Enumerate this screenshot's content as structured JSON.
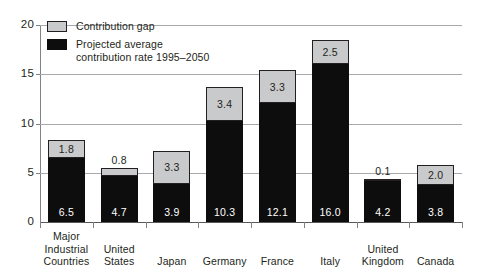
{
  "chart_data": {
    "type": "bar",
    "title": "",
    "subtitle": "",
    "xlabel": "",
    "ylabel": "",
    "ylim": [
      0,
      20
    ],
    "yticks": [
      "0",
      "5",
      "10",
      "15",
      "20"
    ],
    "ytick_values": [
      0,
      5,
      10,
      15,
      20
    ],
    "grid": true,
    "stacked": true,
    "legend_position": "top-left",
    "categories": [
      "Major\nIndustrial\nCountries",
      "United\nStates",
      "Japan",
      "Germany",
      "France",
      "Italy",
      "United\nKingdom",
      "Canada"
    ],
    "series": [
      {
        "name": "Projected average contribution rate 1995–2050",
        "color": "#0d0d0d",
        "values": [
          6.5,
          4.7,
          3.9,
          10.3,
          12.1,
          16.0,
          4.2,
          3.8
        ],
        "labels": [
          "6.5",
          "4.7",
          "3.9",
          "10.3",
          "12.1",
          "16.0",
          "4.2",
          "3.8"
        ]
      },
      {
        "name": "Contribution gap",
        "color": "#c9cacb",
        "values": [
          1.8,
          0.8,
          3.3,
          3.4,
          3.3,
          2.5,
          0.1,
          2.0
        ],
        "labels": [
          "1.8",
          "0.8",
          "3.3",
          "3.4",
          "3.3",
          "2.5",
          "0.1",
          "2.0"
        ]
      }
    ],
    "totals": [
      8.3,
      5.5,
      7.2,
      13.7,
      15.4,
      18.5,
      4.3,
      5.8
    ]
  },
  "legend": {
    "items": [
      {
        "label": "Contribution gap",
        "swatch": "gap"
      },
      {
        "label": "Projected average\ncontribution rate 1995–2050",
        "swatch": "dark"
      }
    ]
  }
}
